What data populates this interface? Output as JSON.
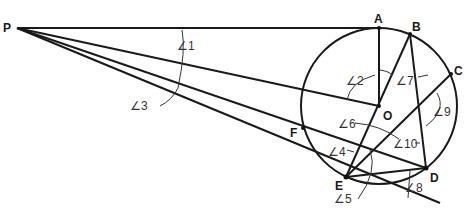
{
  "diagram": {
    "title": "",
    "points": {
      "P": {
        "label": "P",
        "x": 17,
        "y": 28
      },
      "A": {
        "label": "A",
        "x": 379,
        "y": 28
      },
      "B": {
        "label": "B",
        "x": 410,
        "y": 34
      },
      "C": {
        "label": "C",
        "x": 451,
        "y": 74
      },
      "O": {
        "label": "O",
        "x": 379,
        "y": 106
      },
      "D": {
        "label": "D",
        "x": 426,
        "y": 168
      },
      "E": {
        "label": "E",
        "x": 346,
        "y": 177
      },
      "F": {
        "label": "F",
        "x": 303,
        "y": 128
      }
    },
    "circle": {
      "cx": 379,
      "cy": 106,
      "r": 78
    },
    "angles": [
      {
        "label": "∠1"
      },
      {
        "label": "∠2"
      },
      {
        "label": "∠3"
      },
      {
        "label": "∠4"
      },
      {
        "label": "∠5"
      },
      {
        "label": "∠6"
      },
      {
        "label": "∠7"
      },
      {
        "label": "∠8"
      },
      {
        "label": "∠9"
      },
      {
        "label": "∠10"
      }
    ]
  }
}
